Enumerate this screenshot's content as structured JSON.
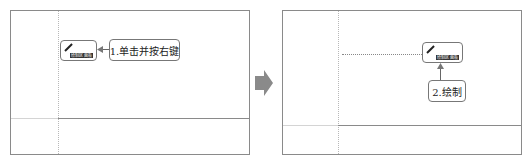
{
  "left_panel": {
    "button_label": "绘制区 面板",
    "callout": "1.单击并按右键"
  },
  "right_panel": {
    "button_label": "绘制区 面板",
    "callout": "2.绘制"
  },
  "colors": {
    "frame": "#8a8a8a",
    "arrow": "#8a8a8a",
    "callout_border": "#777777"
  }
}
